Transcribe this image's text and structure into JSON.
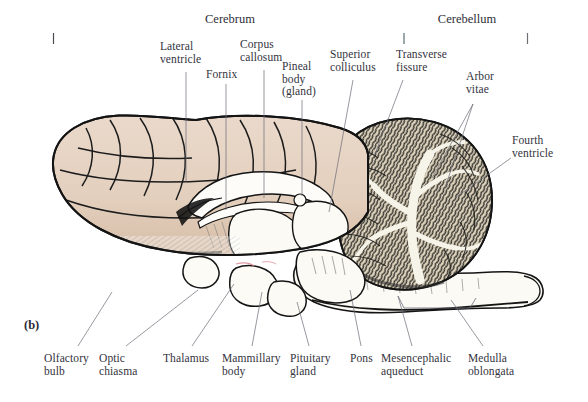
{
  "figure": {
    "panel_marker": "(b)",
    "background_color": "#ffffff",
    "width": 588,
    "height": 402
  },
  "brackets": {
    "cerebrum": {
      "label": "Cerebrum",
      "x_start": 53,
      "x_end": 404,
      "color_start": "#4a4a52",
      "color_end": "#5f8f86"
    },
    "cerebellum": {
      "label": "Cerebellum",
      "x_start": 404,
      "x_end": 528,
      "color_start": "#5f8f86",
      "color_end": "#e49ba4"
    },
    "baseline_y": 33,
    "tick_height": 11
  },
  "artwork": {
    "cerebrum_fill": "#e5d2c2",
    "cerebrum_shade": "#d8c1ad",
    "cerebellum_fill": "#d9cdb4",
    "cerebellum_arbor": "#f4f1e6",
    "brainstem_fill": "#fbfaf5",
    "outline": "#1a1a1a",
    "hatch": "#3a3a3a"
  },
  "labels": {
    "top": [
      {
        "id": "lateral-ventricle",
        "text": "Lateral\nventricle",
        "x": 160,
        "y": 40,
        "align": "left",
        "leader": [
          [
            186,
            72
          ],
          [
            186,
            180
          ]
        ]
      },
      {
        "id": "corpus-callosum",
        "text": "Corpus\ncallosum",
        "x": 240,
        "y": 38,
        "align": "left",
        "leader": [
          [
            264,
            70
          ],
          [
            264,
            196
          ]
        ]
      },
      {
        "id": "fornix",
        "text": "Fornix",
        "x": 206,
        "y": 68,
        "align": "left",
        "leader": [
          [
            226,
            82
          ],
          [
            226,
            208
          ]
        ]
      },
      {
        "id": "pineal-body",
        "text": "Pineal\nbody\n(gland)",
        "x": 282,
        "y": 60,
        "align": "left",
        "leader": [
          [
            302,
            98
          ],
          [
            302,
            197
          ]
        ]
      },
      {
        "id": "superior-colliculus",
        "text": "Superior\ncolliculus",
        "x": 330,
        "y": 48,
        "align": "left",
        "leader": [
          [
            353,
            78
          ],
          [
            329,
            210
          ]
        ]
      },
      {
        "id": "transverse-fissure",
        "text": "Transverse\nfissure",
        "x": 396,
        "y": 48,
        "align": "left",
        "leader": [
          [
            403,
            78
          ],
          [
            376,
            152
          ]
        ]
      },
      {
        "id": "arbor-vitae",
        "text": "Arbor\nvitae",
        "x": 466,
        "y": 70,
        "align": "left",
        "leader": [
          [
            473,
            102
          ],
          [
            432,
            176
          ]
        ],
        "leader2": [
          [
            473,
            102
          ],
          [
            444,
            184
          ]
        ]
      },
      {
        "id": "fourth-ventricle",
        "text": "Fourth\nventricle",
        "x": 512,
        "y": 134,
        "align": "left",
        "leader": [
          [
            512,
            156
          ],
          [
            456,
            196
          ]
        ]
      }
    ],
    "bottom": [
      {
        "id": "olfactory-bulb",
        "text": "Olfactory\nbulb",
        "x": 44,
        "y": 352,
        "leader": [
          [
            78,
            348
          ],
          [
            110,
            295
          ]
        ]
      },
      {
        "id": "optic-chiasma",
        "text": "Optic\nchiasma",
        "x": 99,
        "y": 352,
        "leader": [
          [
            124,
            348
          ],
          [
            198,
            292
          ]
        ]
      },
      {
        "id": "thalamus",
        "text": "Thalamus",
        "x": 163,
        "y": 352,
        "leader": [
          [
            190,
            348
          ],
          [
            233,
            285
          ]
        ]
      },
      {
        "id": "mammillary-body",
        "text": "Mammillary\nbody",
        "x": 222,
        "y": 352,
        "leader": [
          [
            251,
            348
          ],
          [
            262,
            293
          ]
        ]
      },
      {
        "id": "pituitary-gland",
        "text": "Pituitary\ngland",
        "x": 290,
        "y": 352,
        "leader": [
          [
            308,
            348
          ],
          [
            296,
            303
          ]
        ]
      },
      {
        "id": "pons",
        "text": "Pons",
        "x": 350,
        "y": 352,
        "leader": [
          [
            360,
            348
          ],
          [
            349,
            290
          ]
        ]
      },
      {
        "id": "mesencephalic-aqueduct",
        "text": "Mesencephalic\naqueduct",
        "x": 381,
        "y": 352,
        "leader": [
          [
            411,
            348
          ],
          [
            397,
            295
          ]
        ]
      },
      {
        "id": "medulla-oblongata",
        "text": "Medulla\noblongata",
        "x": 468,
        "y": 352,
        "leader": [
          [
            482,
            348
          ],
          [
            450,
            300
          ]
        ]
      }
    ]
  },
  "leader_line": {
    "color": "#6b6b78",
    "width": 0.7
  }
}
